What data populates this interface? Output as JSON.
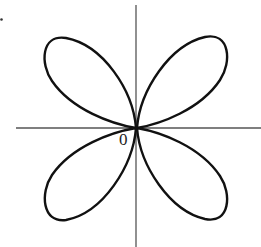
{
  "figure": {
    "type": "four-leaf rose curve",
    "origin_label": "0",
    "petal_count": 4,
    "curve_color": "#111111",
    "axis_color": "#555555"
  }
}
